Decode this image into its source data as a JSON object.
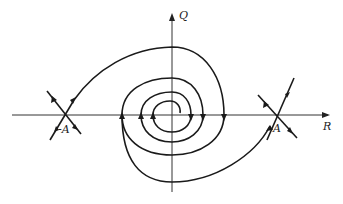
{
  "diagram": {
    "type": "phase-portrait",
    "colors": {
      "stroke": "#1a1a1a",
      "axis": "#333333",
      "background": "#ffffff"
    },
    "axes": {
      "horizontal": {
        "label": "R"
      },
      "vertical": {
        "label": "Q"
      }
    },
    "points": [
      {
        "label": "-A",
        "type": "saddle"
      },
      {
        "label": "A",
        "type": "saddle"
      },
      {
        "label": "",
        "type": "stable-spiral",
        "position": "origin"
      }
    ]
  }
}
